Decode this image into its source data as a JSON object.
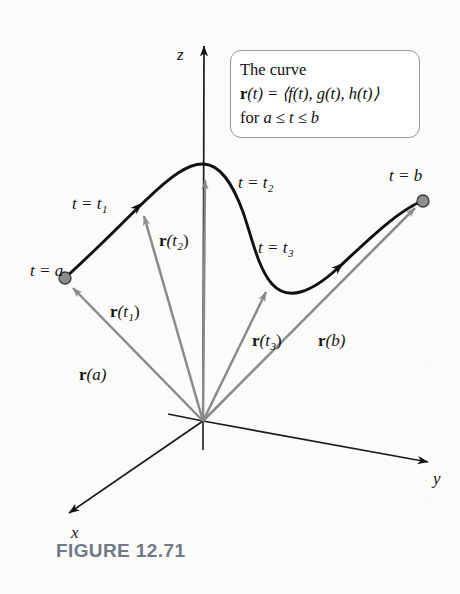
{
  "figure": {
    "caption": "FIGURE 12.71",
    "caption_color": "#6f7a86",
    "background_color": "#fbfbfa",
    "curve_color": "#111111",
    "vector_color": "#8a8a8a",
    "axis_color": "#1a1a1a",
    "point_fill": "#8d8d8d",
    "point_stroke": "#3a3a3a"
  },
  "callout": {
    "line1": "The curve",
    "line2_prefix": "r",
    "line2_rest": "(t) = ⟨f(t), g(t), h(t)⟩",
    "line3_prefix": "for ",
    "line3_rest": "a ≤ t ≤ b",
    "border_color": "#9a9a9a"
  },
  "axes": {
    "z_label": "z",
    "y_label": "y",
    "x_label": "x",
    "origin": {
      "x": 203,
      "y": 421
    }
  },
  "curve_labels": [
    {
      "id": "t-equals-a",
      "text": "t = a",
      "sub": "",
      "x": 30,
      "y": 262
    },
    {
      "id": "t-equals-t1",
      "text": "t = t",
      "sub": "1",
      "x": 72,
      "y": 195
    },
    {
      "id": "t-equals-t2",
      "text": "t = t",
      "sub": "2",
      "x": 238,
      "y": 174
    },
    {
      "id": "t-equals-t3",
      "text": "t = t",
      "sub": "3",
      "x": 258,
      "y": 239
    },
    {
      "id": "t-equals-b",
      "text": "t = b",
      "sub": "",
      "x": 389,
      "y": 167
    }
  ],
  "vector_labels": [
    {
      "id": "vector-r-a",
      "bold": "r",
      "text": "(a)",
      "sub": "",
      "x": 79,
      "y": 366
    },
    {
      "id": "vector-r-t1",
      "bold": "r",
      "text": "(t",
      "sub": "1",
      "x": 110,
      "y": 303
    },
    {
      "id": "vector-r-t2",
      "bold": "r",
      "text": "(t",
      "sub": "2",
      "x": 159,
      "y": 232
    },
    {
      "id": "vector-r-t3",
      "bold": "r",
      "text": "(t",
      "sub": "3",
      "x": 252,
      "y": 332
    },
    {
      "id": "vector-r-b",
      "bold": "r",
      "text": "(b)",
      "sub": "",
      "x": 318,
      "y": 332
    }
  ],
  "geometry": {
    "curve_path": "M 66,277 C 96,250 120,225 146,200 C 170,177 188,163 204,164 C 220,165 232,182 243,212 C 252,238 258,268 272,284 C 288,302 312,292 338,268 C 366,242 396,212 422,201",
    "z_axis": {
      "x1": 203,
      "y1": 421,
      "x2": 204,
      "y2": 46
    },
    "y_axis": {
      "x1": 203,
      "y1": 421,
      "x2": 428,
      "y2": 462
    },
    "x_axis": {
      "x1": 203,
      "y1": 421,
      "x2": 69,
      "y2": 513
    },
    "z_axis_back": {
      "x1": 203,
      "y1": 421,
      "x2": 203,
      "y2": 450
    },
    "y_axis_back": {
      "x1": 203,
      "y1": 421,
      "x2": 168,
      "y2": 414
    },
    "vectors": [
      {
        "id": "vector-arrow-r-a",
        "x1": 203,
        "y1": 421,
        "x2": 73,
        "y2": 288
      },
      {
        "id": "vector-arrow-r-t1",
        "x1": 203,
        "y1": 421,
        "x2": 144,
        "y2": 216
      },
      {
        "id": "vector-arrow-r-t2",
        "x1": 203,
        "y1": 421,
        "x2": 205,
        "y2": 180
      },
      {
        "id": "vector-arrow-r-t3",
        "x1": 203,
        "y1": 421,
        "x2": 266,
        "y2": 292
      },
      {
        "id": "vector-arrow-r-b",
        "x1": 203,
        "y1": 421,
        "x2": 415,
        "y2": 208
      }
    ],
    "points": [
      {
        "id": "point-t-a",
        "x": 65,
        "y": 278,
        "r": 6
      },
      {
        "id": "point-t-b",
        "x": 423,
        "y": 201,
        "r": 6
      }
    ],
    "curve_arrow_1": {
      "x": 140,
      "y": 205,
      "angle": -42
    },
    "curve_arrow_2": {
      "x": 339,
      "y": 266,
      "angle": -42
    }
  }
}
